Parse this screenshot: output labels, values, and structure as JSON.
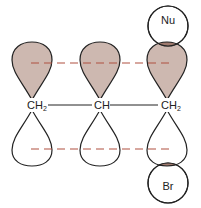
{
  "diagram": {
    "type": "SN2' allylic orbital overlap",
    "carbons": [
      {
        "label": "CH",
        "subscript": "2",
        "x": 32
      },
      {
        "label": "CH",
        "subscript": "",
        "x": 100
      },
      {
        "label": "CH",
        "subscript": "2",
        "x": 167
      }
    ],
    "nucleophile": {
      "label": "Nu"
    },
    "leaving_group": {
      "label": "Br"
    },
    "colors": {
      "lobe_fill": "#cdb8b0",
      "overlap_fill": "#a07a6e",
      "dash": "#b05040",
      "stroke": "#222222"
    }
  }
}
